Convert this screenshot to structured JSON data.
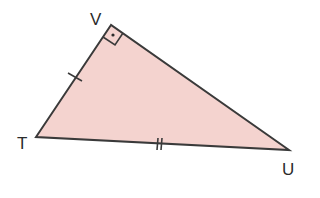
{
  "diagram": {
    "type": "right-triangle",
    "colors": {
      "fill": "#f4d3cf",
      "stroke": "#3a3a3a",
      "label": "#2b2b2b",
      "background": "#ffffff"
    },
    "vertices": {
      "V": {
        "label": "V",
        "x": 111,
        "y": 25,
        "right_angle": true
      },
      "T": {
        "label": "T",
        "x": 36,
        "y": 137
      },
      "U": {
        "label": "U",
        "x": 289,
        "y": 150
      }
    },
    "markings": {
      "right_angle_at": "V",
      "side_VT_ticks": 1,
      "side_TU_ticks": 2
    }
  }
}
